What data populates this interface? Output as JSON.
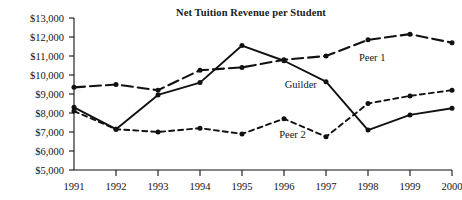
{
  "chart_data": {
    "type": "line",
    "title": "Net Tuition Revenue per Student",
    "xlabel": "",
    "ylabel": "",
    "x": [
      "1991",
      "1992",
      "1993",
      "1994",
      "1995",
      "1996",
      "1997",
      "1998",
      "1999",
      "2000"
    ],
    "categories": [
      "1991",
      "1992",
      "1993",
      "1994",
      "1995",
      "1996",
      "1997",
      "1998",
      "1999",
      "2000"
    ],
    "ylim": [
      5000,
      13000
    ],
    "ytick_values": [
      5000,
      6000,
      7000,
      8000,
      9000,
      10000,
      11000,
      12000,
      13000
    ],
    "ytick_labels": [
      "$5,000",
      "$6,000",
      "$7,000",
      "$8,000",
      "$9,000",
      "$10,000",
      "$11,000",
      "$12,000",
      "$13,000"
    ],
    "grid": false,
    "legend_position": "inline-annotations",
    "series": [
      {
        "name": "Guilder",
        "style": "solid",
        "marker": "filled-circle",
        "values": [
          8300,
          7150,
          8950,
          9600,
          11550,
          10750,
          9650,
          7100,
          7900,
          8250
        ]
      },
      {
        "name": "Peer 1",
        "style": "long-dash",
        "marker": "filled-circle",
        "values": [
          9350,
          9500,
          9200,
          10250,
          10400,
          10800,
          11000,
          11850,
          12150,
          11700
        ]
      },
      {
        "name": "Peer 2",
        "style": "short-dash",
        "marker": "filled-circle",
        "values": [
          8100,
          7150,
          7000,
          7200,
          6900,
          7700,
          6750,
          8500,
          8900,
          9200
        ]
      }
    ],
    "annotations": [
      {
        "text": "Peer 1",
        "x_value": 1998.1,
        "y_value": 10750
      },
      {
        "text": "Guilder",
        "x_value": 1996.4,
        "y_value": 9300
      },
      {
        "text": "Peer 2",
        "x_value": 1996.2,
        "y_value": 6700
      }
    ]
  },
  "colors": {
    "ink": "#111111",
    "background": "#ffffff"
  }
}
